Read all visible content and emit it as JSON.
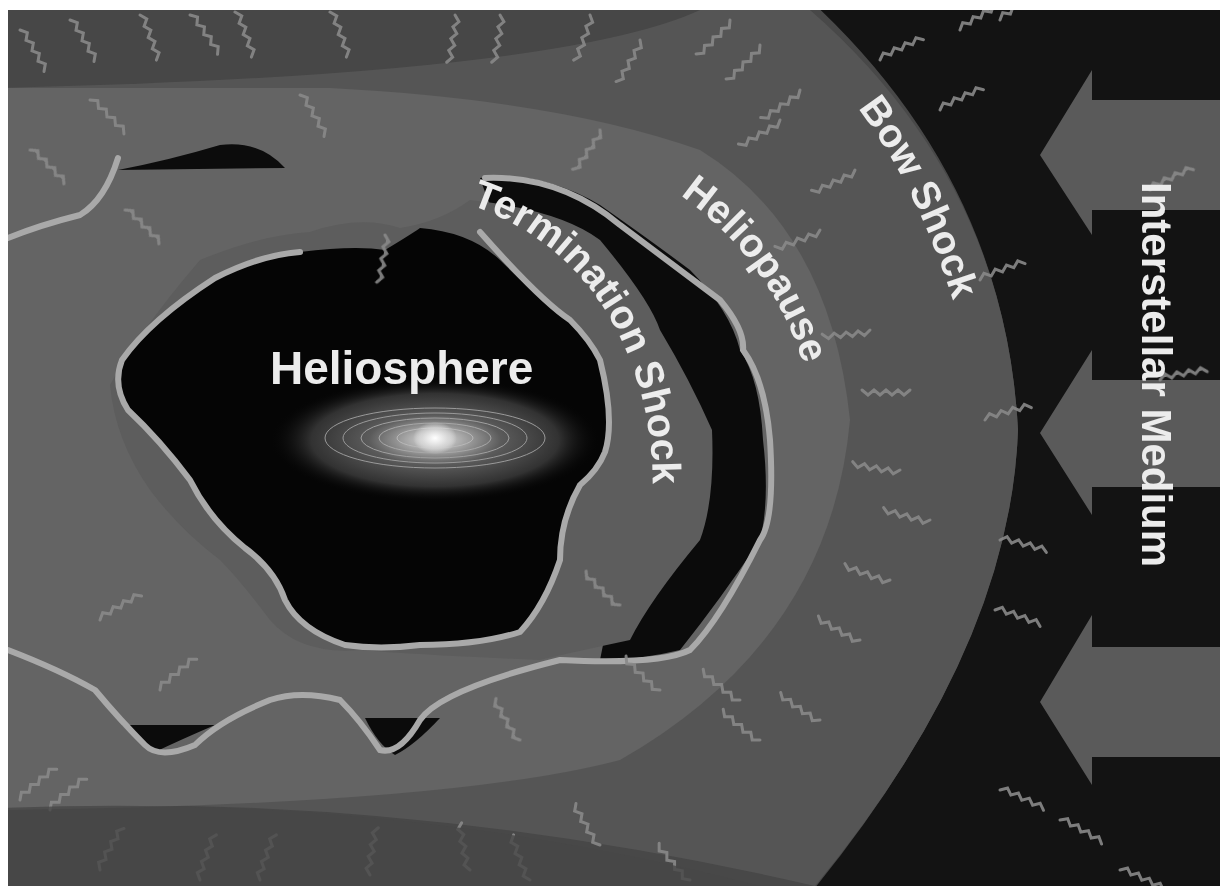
{
  "diagram": {
    "labels": {
      "heliosphere": "Heliosphere",
      "termination_shock": "Termination Shock",
      "heliopause": "Heliopause",
      "bow_shock": "Bow Shock",
      "interstellar_medium": "Interstellar Medium"
    },
    "colors": {
      "frame": "#ffffff",
      "outer_region": "#4a4a4a",
      "interstellar_black": "#141414",
      "bow_shock_region": "#555555",
      "heliosheath": "#6a6a6a",
      "heliopause_gap": "#0c0c0c",
      "boundary_line": "#a9a9a9",
      "heliosphere_core": "#050505",
      "arrow": "#5c5c5c",
      "text": "#ececec"
    },
    "arrows": [
      {
        "direction": "left",
        "y_center": 155
      },
      {
        "direction": "left",
        "y_center": 433
      },
      {
        "direction": "left",
        "y_center": 702
      }
    ]
  }
}
